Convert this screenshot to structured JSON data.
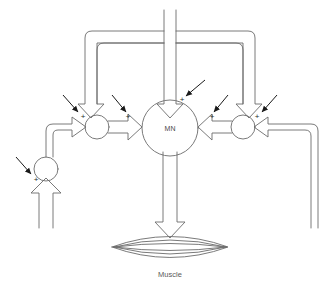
{
  "figure": {
    "title_cropped": "",
    "background_color": "#ffffff",
    "line_color": "#6b6b6b",
    "arrow_color": "#1a1a1a",
    "label_color": "#4a4a4a"
  },
  "nodes": [
    {
      "id": "mn",
      "label": "MN",
      "shape": "circle",
      "cx": 170,
      "cy": 128,
      "r": 28
    },
    {
      "id": "left-inter",
      "label": "",
      "shape": "circle",
      "cx": 97,
      "cy": 127,
      "r": 12
    },
    {
      "id": "right-inter",
      "label": "",
      "shape": "circle",
      "cx": 243,
      "cy": 127,
      "r": 12
    },
    {
      "id": "lower-left",
      "label": "",
      "shape": "circle",
      "cx": 46,
      "cy": 169,
      "r": 12
    }
  ],
  "effector": {
    "id": "muscle",
    "label": "Muscle",
    "shape": "spindle",
    "cx": 170,
    "cy": 247,
    "width": 116,
    "height": 30,
    "striation_count": 5
  },
  "signs": [
    {
      "id": "sign-mn-top",
      "text": "+",
      "x": 182,
      "y": 100
    },
    {
      "id": "sign-mn-left",
      "text": "+",
      "x": 128,
      "y": 117
    },
    {
      "id": "sign-mn-right",
      "text": "+",
      "x": 212,
      "y": 117
    },
    {
      "id": "sign-left-inter",
      "text": "+",
      "x": 83,
      "y": 117
    },
    {
      "id": "sign-right-inter",
      "text": "+",
      "x": 257,
      "y": 117
    },
    {
      "id": "sign-lower-left",
      "text": "+",
      "x": 36,
      "y": 180
    }
  ],
  "modulatory_arrows": [
    {
      "id": "mod-arrow-mn",
      "x1": 205,
      "y1": 80,
      "x2": 186,
      "y2": 96
    },
    {
      "id": "mod-arrow-left-inter",
      "x1": 63,
      "y1": 95,
      "x2": 78,
      "y2": 112
    },
    {
      "id": "mod-arrow-mn-left",
      "x1": 112,
      "y1": 95,
      "x2": 126,
      "y2": 112
    },
    {
      "id": "mod-arrow-mn-right",
      "x1": 228,
      "y1": 95,
      "x2": 214,
      "y2": 112
    },
    {
      "id": "mod-arrow-right-inter",
      "x1": 277,
      "y1": 95,
      "x2": 262,
      "y2": 112
    },
    {
      "id": "mod-arrow-lower-left",
      "x1": 16,
      "y1": 157,
      "x2": 31,
      "y2": 174
    }
  ],
  "legend": {
    "excitatory_symbol": "+",
    "pathway_style": "hollow-double-line-arrow",
    "modulator_style": "thin-solid-arrow"
  }
}
